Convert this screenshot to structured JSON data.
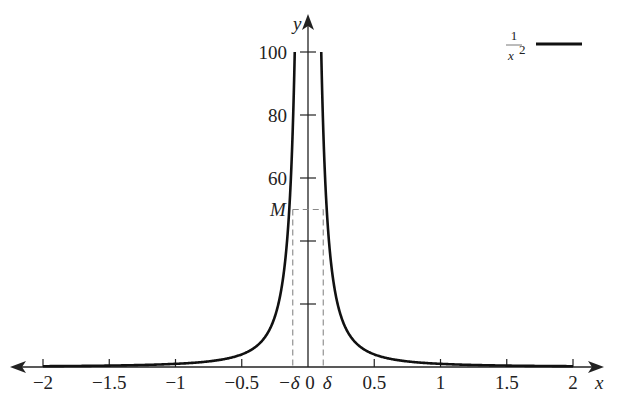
{
  "chart_data": {
    "type": "line",
    "title": "",
    "xlabel": "x",
    "ylabel": "y",
    "xlim": [
      -2,
      2
    ],
    "ylim": [
      0,
      100
    ],
    "grid": false,
    "legend_position": "top-right",
    "x_ticks": [
      {
        "value": -2,
        "label": "−2"
      },
      {
        "value": -1.5,
        "label": "−1.5"
      },
      {
        "value": -1,
        "label": "−1"
      },
      {
        "value": -0.5,
        "label": "−0.5"
      },
      {
        "value": 0.5,
        "label": "0.5"
      },
      {
        "value": 1,
        "label": "1"
      },
      {
        "value": 1.5,
        "label": "1.5"
      },
      {
        "value": 2,
        "label": "2"
      }
    ],
    "x_special_labels": [
      {
        "value": -0.115,
        "label": "−δ"
      },
      {
        "value": 0,
        "label": "0"
      },
      {
        "value": 0.115,
        "label": "δ"
      }
    ],
    "y_ticks": [
      {
        "value": 20,
        "label": ""
      },
      {
        "value": 40,
        "label": ""
      },
      {
        "value": 60,
        "label": "60"
      },
      {
        "value": 80,
        "label": "80"
      },
      {
        "value": 100,
        "label": "100"
      }
    ],
    "annotations": [
      {
        "type": "hline-dashed",
        "y": 50,
        "label": "M",
        "x_from": -0.115,
        "x_to": 0.115
      },
      {
        "type": "vline-dashed",
        "x": -0.115,
        "label": "−δ"
      },
      {
        "type": "vline-dashed",
        "x": 0.115,
        "label": "δ"
      }
    ],
    "series": [
      {
        "name": "1/x^2",
        "legend_label": "1/x²",
        "function": "1/x^2",
        "color": "#111111",
        "domain": [
          [
            -2,
            -0.1
          ],
          [
            0.1,
            2
          ]
        ],
        "x": [
          -2,
          -1.5,
          -1,
          -0.75,
          -0.5,
          -0.4,
          -0.3,
          -0.25,
          -0.2,
          -0.15,
          -0.12,
          -0.1,
          0.1,
          0.12,
          0.15,
          0.2,
          0.25,
          0.3,
          0.4,
          0.5,
          0.75,
          1,
          1.5,
          2
        ],
        "y": [
          0.25,
          0.444,
          1,
          1.778,
          4,
          6.25,
          11.11,
          16,
          25,
          44.44,
          69.44,
          100,
          100,
          69.44,
          44.44,
          25,
          16,
          11.11,
          6.25,
          4,
          1.778,
          1,
          0.444,
          0.25
        ]
      }
    ]
  },
  "legend": {
    "numerator": "1",
    "denominator": "x",
    "exponent": "2"
  },
  "axes": {
    "x_name": "x",
    "y_name": "y",
    "m_label": "M",
    "m_value": 50,
    "delta": 0.115
  }
}
